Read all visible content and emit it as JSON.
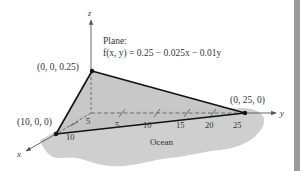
{
  "diagram": {
    "title_label": "Plane:",
    "equation": "f(x, y) = 0.25 − 0.025x − 0.01y",
    "axes": {
      "x_label": "x",
      "y_label": "y",
      "z_label": "z"
    },
    "vertices": {
      "top": "(0, 0, 0.25)",
      "x_intercept": "(10, 0, 0)",
      "y_intercept": "(0, 25, 0)"
    },
    "y_ticks": [
      "5",
      "10",
      "15",
      "20",
      "25"
    ],
    "x_ticks": [
      "5",
      "10"
    ],
    "region_label": "Ocean",
    "colors": {
      "ocean": "#cfcfcf",
      "plane": "#c4c4c4",
      "edge": "#111111",
      "axis": "#555555",
      "text": "#333333",
      "side_bar": "#9a9a9a"
    }
  }
}
